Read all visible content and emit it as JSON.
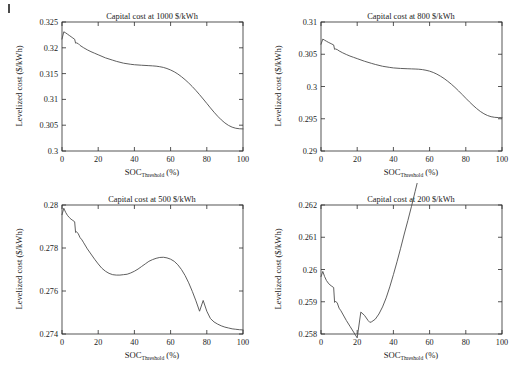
{
  "figure": {
    "background": "#ffffff",
    "curve_color": "#4d4d4d",
    "axis_color": "#2b2b2b",
    "corner_mark": "page-edge-artifact"
  },
  "chart_data": [
    {
      "id": "panel-1000",
      "type": "line",
      "title": "Capital cost at 1000 $/kWh",
      "xlabel_main": "SOC",
      "xlabel_sub": "Threshold",
      "xlabel_unit": " (%)",
      "ylabel": "Levelized cost ($/kWh)",
      "xlim": [
        0,
        100
      ],
      "ylim": [
        0.3,
        0.325
      ],
      "xticks": [
        0,
        20,
        40,
        60,
        80,
        100
      ],
      "xticklabels": [
        "0",
        "20",
        "40",
        "60",
        "80",
        "100"
      ],
      "yticks": [
        0.3,
        0.305,
        0.31,
        0.315,
        0.32,
        0.325
      ],
      "yticklabels": [
        "0.3",
        "0.305",
        "0.31",
        "0.315",
        "0.32",
        "0.325"
      ],
      "grid": false,
      "legend": null,
      "x": [
        0,
        1,
        2,
        3,
        4,
        5,
        6,
        7,
        7.5,
        8,
        9,
        10,
        12,
        14,
        16,
        18,
        20,
        24,
        28,
        30,
        34,
        38,
        40,
        44,
        48,
        50,
        52,
        54,
        56,
        58,
        60,
        62,
        64,
        66,
        68,
        70,
        72,
        74,
        76,
        78,
        80,
        82,
        84,
        86,
        88,
        90,
        92,
        94,
        96,
        98,
        100
      ],
      "y": [
        0.3217,
        0.3231,
        0.3229,
        0.32265,
        0.3224,
        0.32215,
        0.3219,
        0.32165,
        0.3209,
        0.32095,
        0.3208,
        0.32045,
        0.32,
        0.3196,
        0.31925,
        0.31895,
        0.31865,
        0.31805,
        0.3176,
        0.31738,
        0.31702,
        0.3168,
        0.31672,
        0.31662,
        0.31654,
        0.3165,
        0.31644,
        0.31634,
        0.3162,
        0.31598,
        0.3157,
        0.31535,
        0.31492,
        0.3144,
        0.31382,
        0.31318,
        0.31248,
        0.31172,
        0.31092,
        0.31008,
        0.30922,
        0.30836,
        0.30752,
        0.30674,
        0.30604,
        0.30544,
        0.30496,
        0.30462,
        0.30441,
        0.30431,
        0.30428
      ]
    },
    {
      "id": "panel-800",
      "type": "line",
      "title": "Capital cost at 800 $/kWh",
      "xlabel_main": "SOC",
      "xlabel_sub": "Threshold",
      "xlabel_unit": " (%)",
      "ylabel": "Levelized cost ($/kWh)",
      "xlim": [
        0,
        100
      ],
      "ylim": [
        0.29,
        0.31
      ],
      "xticks": [
        0,
        20,
        40,
        60,
        80,
        100
      ],
      "xticklabels": [
        "0",
        "20",
        "40",
        "60",
        "80",
        "100"
      ],
      "yticks": [
        0.29,
        0.295,
        0.3,
        0.305,
        0.31
      ],
      "yticklabels": [
        "0.29",
        "0.295",
        "0.3",
        "0.305",
        "0.31"
      ],
      "grid": false,
      "legend": null,
      "x": [
        0,
        1,
        2,
        3,
        4,
        5,
        6,
        7,
        7.5,
        8,
        9,
        10,
        12,
        14,
        16,
        18,
        20,
        24,
        28,
        30,
        34,
        38,
        40,
        44,
        48,
        50,
        52,
        54,
        56,
        58,
        60,
        62,
        64,
        66,
        68,
        70,
        72,
        74,
        76,
        78,
        80,
        82,
        84,
        86,
        88,
        90,
        92,
        94,
        96,
        98,
        100
      ],
      "y": [
        0.30655,
        0.30735,
        0.30718,
        0.30702,
        0.30686,
        0.30672,
        0.30658,
        0.30644,
        0.30576,
        0.30582,
        0.30572,
        0.30552,
        0.30522,
        0.30496,
        0.30472,
        0.30452,
        0.30432,
        0.30392,
        0.30358,
        0.30342,
        0.30314,
        0.30296,
        0.30288,
        0.3028,
        0.30275,
        0.30273,
        0.30271,
        0.30268,
        0.30262,
        0.30252,
        0.30238,
        0.30218,
        0.30192,
        0.3016,
        0.30124,
        0.30082,
        0.30036,
        0.29986,
        0.29932,
        0.29876,
        0.29818,
        0.29762,
        0.29708,
        0.29658,
        0.29614,
        0.29578,
        0.2955,
        0.29532,
        0.29522,
        0.29518,
        0.29516
      ]
    },
    {
      "id": "panel-500",
      "type": "line",
      "title": "Capital cost at 500 $/kWh",
      "xlabel_main": "SOC",
      "xlabel_sub": "Threshold",
      "xlabel_unit": " (%)",
      "ylabel": "Levelized cost ($/kWh)",
      "xlim": [
        0,
        100
      ],
      "ylim": [
        0.274,
        0.28
      ],
      "xticks": [
        0,
        20,
        40,
        60,
        80,
        100
      ],
      "xticklabels": [
        "0",
        "20",
        "40",
        "60",
        "80",
        "100"
      ],
      "yticks": [
        0.274,
        0.276,
        0.278,
        0.28
      ],
      "yticklabels": [
        "0.274",
        "0.276",
        "0.278",
        "0.28"
      ],
      "grid": false,
      "legend": null,
      "x": [
        0,
        1,
        2,
        3,
        4,
        5,
        6,
        7,
        7.5,
        8,
        9,
        10,
        11,
        12,
        14,
        16,
        18,
        20,
        22,
        24,
        26,
        28,
        30,
        32,
        34,
        36,
        38,
        40,
        42,
        44,
        46,
        48,
        50,
        52,
        54,
        56,
        58,
        60,
        62,
        64,
        66,
        68,
        70,
        72,
        74,
        76,
        78,
        80,
        82,
        84,
        86,
        88,
        90,
        92,
        94,
        96,
        98,
        100
      ],
      "y": [
        0.27955,
        0.27985,
        0.27966,
        0.27952,
        0.27942,
        0.27934,
        0.27928,
        0.27922,
        0.27872,
        0.27876,
        0.27866,
        0.27848,
        0.27838,
        0.27824,
        0.27796,
        0.27772,
        0.27748,
        0.27726,
        0.27706,
        0.27692,
        0.27682,
        0.27676,
        0.27674,
        0.27674,
        0.27676,
        0.27678,
        0.27684,
        0.27692,
        0.27702,
        0.27714,
        0.27726,
        0.27738,
        0.27746,
        0.27752,
        0.27756,
        0.27757,
        0.27754,
        0.27748,
        0.27738,
        0.27722,
        0.277,
        0.27672,
        0.27638,
        0.27598,
        0.27554,
        0.27506,
        0.27556,
        0.27506,
        0.27472,
        0.27456,
        0.27446,
        0.27438,
        0.27432,
        0.27428,
        0.27424,
        0.27422,
        0.2742,
        0.27419
      ]
    },
    {
      "id": "panel-200",
      "type": "line",
      "title": "Capital cost at 200 $/kWh",
      "xlabel_main": "SOC",
      "xlabel_sub": "Threshold",
      "xlabel_unit": " (%)",
      "ylabel": "Levelized cost ($/kWh)",
      "xlim": [
        0,
        100
      ],
      "ylim": [
        0.258,
        0.262
      ],
      "xticks": [
        0,
        20,
        40,
        60,
        80,
        100
      ],
      "xticklabels": [
        "0",
        "20",
        "40",
        "60",
        "80",
        "100"
      ],
      "yticks": [
        0.258,
        0.259,
        0.26,
        0.261,
        0.262
      ],
      "yticklabels": [
        "0.258",
        "0.259",
        "0.26",
        "0.261",
        "0.262"
      ],
      "grid": false,
      "legend": null,
      "x": [
        0,
        1,
        2,
        3,
        4,
        5,
        6,
        7,
        7.5,
        8,
        9,
        10,
        11,
        12,
        14,
        16,
        18,
        20,
        22,
        24,
        26,
        27,
        28,
        30,
        32,
        34,
        36,
        38,
        40,
        42,
        44,
        46,
        48,
        50,
        52,
        54,
        56,
        58,
        60,
        62,
        64,
        66,
        68,
        70,
        72,
        74,
        76,
        78,
        80,
        82,
        84,
        86,
        88,
        90,
        92,
        94,
        96,
        98,
        100
      ],
      "y": [
        0.25978,
        0.25994,
        0.25978,
        0.25966,
        0.25958,
        0.25952,
        0.25948,
        0.25944,
        0.25898,
        0.25902,
        0.25896,
        0.2588,
        0.25872,
        0.25862,
        0.25842,
        0.25824,
        0.25806,
        0.25788,
        0.25868,
        0.25858,
        0.25842,
        0.25836,
        0.25838,
        0.25846,
        0.25862,
        0.25884,
        0.25912,
        0.25946,
        0.25984,
        0.26024,
        0.26066,
        0.2611,
        0.26152,
        0.26196,
        0.26242,
        0.26288,
        0.26332,
        0.26374,
        0.26414,
        0.26452,
        0.26488,
        0.26522,
        0.26554,
        0.2658,
        0.26602,
        0.26618,
        0.2663,
        0.26638,
        0.26643,
        0.26646,
        0.26648,
        0.26649,
        0.26648,
        0.26646,
        0.26642,
        0.26636,
        0.26628,
        0.26618,
        0.26606
      ]
    }
  ]
}
